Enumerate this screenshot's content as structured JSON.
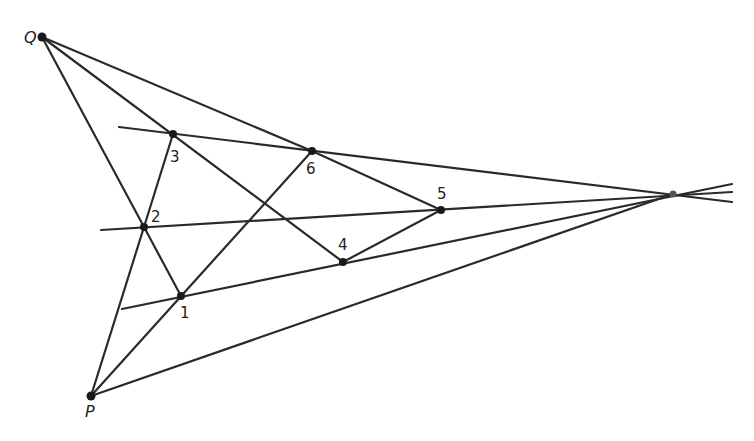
{
  "diagram": {
    "points": {
      "Q": {
        "label": "Q",
        "x": 42,
        "y": 37
      },
      "P": {
        "label": "P",
        "x": 91,
        "y": 396
      },
      "V": {
        "label": "",
        "x": 673,
        "y": 194
      },
      "p1": {
        "label": "1",
        "x": 181,
        "y": 296
      },
      "p2": {
        "label": "2",
        "x": 144,
        "y": 227
      },
      "p3": {
        "label": "3",
        "x": 173,
        "y": 134
      },
      "p4": {
        "label": "4",
        "x": 343,
        "y": 262
      },
      "p5": {
        "label": "5",
        "x": 441,
        "y": 210
      },
      "p6": {
        "label": "6",
        "x": 312,
        "y": 151
      }
    },
    "labels": {
      "Q": "Q",
      "P": "P",
      "p1": "1",
      "p2": "2",
      "p3": "3",
      "p4": "4",
      "p5": "5",
      "p6": "6"
    },
    "caption": "…"
  }
}
